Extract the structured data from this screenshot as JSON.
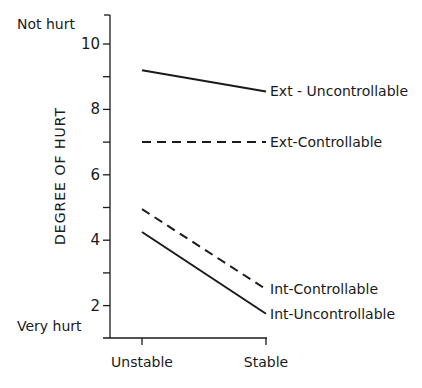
{
  "chart_data": {
    "type": "line",
    "title": "",
    "xlabel": "",
    "ylabel": "DEGREE OF HURT",
    "categories": [
      "Unstable",
      "Stable"
    ],
    "ylim": [
      1,
      10.9
    ],
    "yticks_labeled": [
      2,
      4,
      6,
      8,
      10
    ],
    "yticks_minor": [
      3,
      5,
      7,
      9
    ],
    "y_annotations": {
      "top": "Not hurt",
      "bottom": "Very hurt"
    },
    "grid": false,
    "legend": "inline labels at line ends (right)",
    "series": [
      {
        "name": "Ext - Uncontrollable",
        "style": "solid",
        "values": [
          9.2,
          8.55
        ]
      },
      {
        "name": "Ext-Controllable",
        "style": "dashed",
        "values": [
          7.0,
          7.0
        ]
      },
      {
        "name": "Int-Controllable",
        "style": "dashed",
        "values": [
          4.95,
          2.5
        ]
      },
      {
        "name": "Int-Uncontrollable",
        "style": "solid",
        "values": [
          4.25,
          1.75
        ]
      }
    ]
  },
  "colors": {
    "ink": "#1a1a1a",
    "background": "#ffffff"
  }
}
